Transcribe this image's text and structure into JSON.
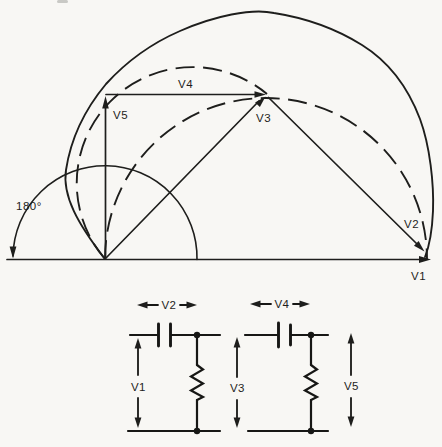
{
  "colors": {
    "ink": "#1e1e1c",
    "background": "#f8f7f4"
  },
  "phasor_diagram": {
    "angle_label": "180°",
    "v1_label": "V1",
    "v2_label": "V2",
    "v3_label": "V3",
    "v4_label": "V4",
    "v5_label": "V5"
  },
  "circuits": {
    "left": {
      "capacitor_voltage": "V2",
      "input_voltage": "V1"
    },
    "right": {
      "capacitor_voltage": "V4",
      "input_voltage": "V3",
      "output_voltage": "V5"
    }
  }
}
